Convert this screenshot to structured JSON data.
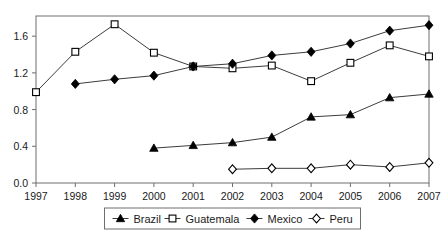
{
  "chart_data": {
    "type": "line",
    "title": "",
    "subtitle": "",
    "xlabel": "",
    "ylabel": "",
    "x": [
      1997,
      1998,
      1999,
      2000,
      2001,
      2002,
      2003,
      2004,
      2005,
      2006,
      2007
    ],
    "xtick_labels": [
      "1997",
      "1998",
      "1999",
      "2000",
      "2001",
      "2002",
      "2003",
      "2004",
      "2005",
      "2006",
      "2007"
    ],
    "ytick_labels": [
      "0.0",
      "0.4",
      "0.8",
      "1.2",
      "1.6"
    ],
    "yticks": [
      0.0,
      0.4,
      0.8,
      1.2,
      1.6
    ],
    "ylim": [
      0.0,
      1.82
    ],
    "xlim": [
      1997,
      2007
    ],
    "grid": false,
    "legend_position": "bottom-center",
    "series": [
      {
        "name": "Brazil",
        "marker": "filled-triangle",
        "color": "#000000",
        "x": [
          2000,
          2001,
          2002,
          2003,
          2004,
          2005,
          2006,
          2007
        ],
        "values": [
          0.38,
          0.41,
          0.44,
          0.5,
          0.72,
          0.745,
          0.93,
          0.97
        ]
      },
      {
        "name": "Guatemala",
        "marker": "open-square",
        "color": "#000000",
        "x": [
          1997,
          1998,
          1999,
          2000,
          2001,
          2002,
          2003,
          2004,
          2005,
          2006,
          2007
        ],
        "values": [
          0.99,
          1.43,
          1.73,
          1.42,
          1.27,
          1.25,
          1.28,
          1.11,
          1.31,
          1.5,
          1.38
        ]
      },
      {
        "name": "Mexico",
        "marker": "filled-diamond",
        "color": "#000000",
        "x": [
          1998,
          1999,
          2000,
          2001,
          2002,
          2003,
          2004,
          2005,
          2006,
          2007
        ],
        "values": [
          1.08,
          1.13,
          1.17,
          1.27,
          1.3,
          1.39,
          1.43,
          1.52,
          1.66,
          1.72
        ]
      },
      {
        "name": "Peru",
        "marker": "open-diamond",
        "color": "#000000",
        "x": [
          2002,
          2003,
          2004,
          2005,
          2006,
          2007
        ],
        "values": [
          0.15,
          0.16,
          0.16,
          0.2,
          0.175,
          0.22
        ]
      }
    ]
  },
  "legend": {
    "items": [
      {
        "label": "Brazil",
        "marker": "filled-triangle"
      },
      {
        "label": "Guatemala",
        "marker": "open-square"
      },
      {
        "label": "Mexico",
        "marker": "filled-diamond"
      },
      {
        "label": "Peru",
        "marker": "open-diamond"
      }
    ]
  },
  "colors": {
    "line": "#3c3c3c",
    "marker": "#000000",
    "axis": "#6e6e6e",
    "text": "#1a1a1a",
    "background": "#ffffff"
  }
}
